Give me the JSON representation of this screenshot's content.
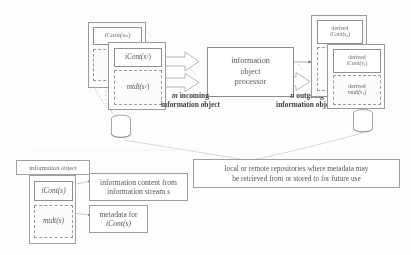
{
  "figure": {
    "background_color": "#fdfdfd",
    "stroke_color": "#8f8f8f",
    "text_color": "#585858"
  },
  "input_stack": {
    "back_object": {
      "content_label": "iCont(s",
      "content_sub": "m",
      "content_close": ")",
      "metadata_label": "mtd",
      "metadata_sub": "m",
      "metadata_close": ""
    },
    "front_object": {
      "content_label": "iCont(s",
      "content_sub": "1",
      "content_close": ")",
      "metadata_label": "mtdt(s",
      "metadata_sub": "1",
      "metadata_close": ")"
    }
  },
  "processor": {
    "line1": "information",
    "line2": "object",
    "line3": "processor"
  },
  "arrows": {
    "incoming_count": "m",
    "incoming_label_line1": "incoming",
    "incoming_label_line2": "information object",
    "outgoing_count": "n",
    "outgoing_label_line1": "outgoing",
    "outgoing_label_line2": "information objects"
  },
  "output_stack": {
    "back_object": {
      "derived_word": "derived",
      "content_label": "iCont(s",
      "content_sub": "n",
      "content_close": ")",
      "metadata_derived_word": "derived",
      "metadata_label": "mtdt(s",
      "metadata_sub": "n",
      "metadata_close": ")"
    },
    "front_object": {
      "derived_word": "derived",
      "content_label": "iCont(s",
      "content_sub": "1",
      "content_close": ")",
      "metadata_derived_word": "derived",
      "metadata_label": "mtdt(s",
      "metadata_sub": "1",
      "metadata_close": ")"
    }
  },
  "repositories": {
    "caption_line1": "local or remote repositories where metadata may",
    "caption_line2": "be retrieved from or stored to for future use",
    "left_store_name": "database-cylinder",
    "right_store_name": "database-cylinder"
  },
  "legend": {
    "title": "information object",
    "content_label": "iCont(s)",
    "metadata_label": "mtdt(s)",
    "content_note_line1": "information content from",
    "content_note_line2a": "information stream ",
    "content_note_line2b": "s",
    "metadata_note_line1": "metadata for",
    "metadata_note_line2": "iCont(s)"
  }
}
